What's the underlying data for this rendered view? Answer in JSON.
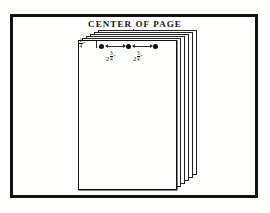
{
  "figure": {
    "caption": "CENTER OF PAGE",
    "background_color": "#fdfdfc",
    "ink_color": "#121212"
  },
  "stack": {
    "sheet_count": 6,
    "description": "fanned stack of paper sheets offset up and to the right"
  },
  "dimensions": {
    "left_margin": {
      "whole": "",
      "numerator": "1",
      "denominator": "4",
      "unit": "\""
    },
    "span_one": {
      "whole": "2",
      "numerator": "3",
      "denominator": "4",
      "unit": "\""
    },
    "span_two": {
      "whole": "2",
      "numerator": "3",
      "denominator": "4",
      "unit": "\""
    }
  },
  "staples": {
    "count": 3,
    "positions_px": [
      101,
      128,
      155
    ]
  }
}
